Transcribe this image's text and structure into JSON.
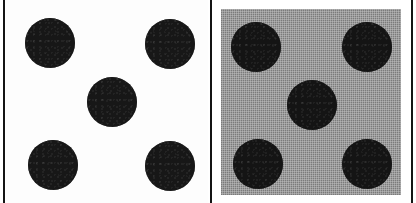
{
  "figure": {
    "width_px": 416,
    "height_px": 203,
    "background_color": "#ffffff",
    "divider_color": "#141414"
  },
  "panels": [
    {
      "id": "panel-white",
      "label": "Left panel",
      "caption": "",
      "background_kind": "plain-white",
      "background_color": "#fdfdfd",
      "frame": {
        "x": 6,
        "y": 0,
        "w": 202,
        "h": 203
      },
      "dot_color": "#171717",
      "dot_diameter_px": 50,
      "dot_count": 5,
      "dots": [
        {
          "name": "dot-top-left",
          "cx": 44,
          "cy": 43,
          "r": 25
        },
        {
          "name": "dot-top-right",
          "cx": 164,
          "cy": 44,
          "r": 25
        },
        {
          "name": "dot-center",
          "cx": 106,
          "cy": 102,
          "r": 25
        },
        {
          "name": "dot-bottom-left",
          "cx": 47,
          "cy": 165,
          "r": 25
        },
        {
          "name": "dot-bottom-right",
          "cx": 164,
          "cy": 166,
          "r": 25
        }
      ]
    },
    {
      "id": "panel-gray",
      "label": "Right panel",
      "caption": "",
      "background_kind": "dithered-halftone-gray",
      "background_color": "#9d9d9d",
      "frame": {
        "x": 221,
        "y": 9,
        "w": 180,
        "h": 186
      },
      "dot_color": "#141414",
      "dot_diameter_px": 50,
      "dot_count": 5,
      "dots": [
        {
          "name": "dot-top-left",
          "cx": 35,
          "cy": 38,
          "r": 25
        },
        {
          "name": "dot-top-right",
          "cx": 146,
          "cy": 38,
          "r": 25
        },
        {
          "name": "dot-center",
          "cx": 91,
          "cy": 96,
          "r": 25
        },
        {
          "name": "dot-bottom-left",
          "cx": 37,
          "cy": 155,
          "r": 25
        },
        {
          "name": "dot-bottom-right",
          "cx": 146,
          "cy": 155,
          "r": 25
        }
      ]
    }
  ],
  "rules": [
    {
      "name": "rule-left",
      "x": 3,
      "color": "#141414"
    },
    {
      "name": "rule-mid",
      "x": 210,
      "color": "#141414"
    },
    {
      "name": "rule-right",
      "x": 411,
      "color": "#141414"
    }
  ]
}
